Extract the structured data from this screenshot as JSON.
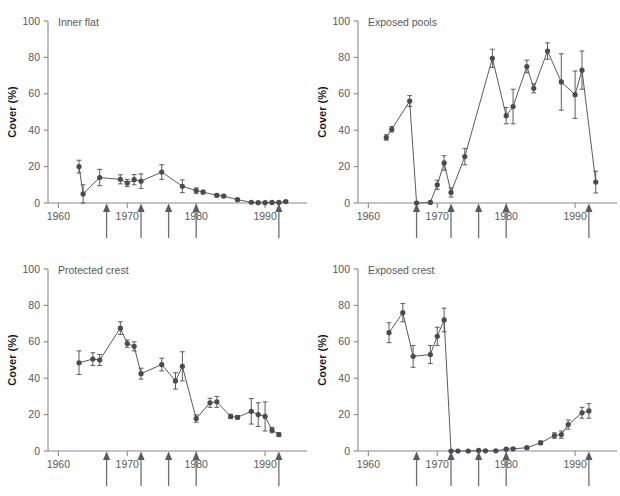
{
  "figure": {
    "background": "#ffffff",
    "marker_color": "#4a4a52",
    "line_color": "#5a5a62",
    "axis_color": "#8a8a8a",
    "text_color": "#58595b",
    "axis_label": "Cover (%)",
    "y_ticks": [
      0,
      20,
      40,
      60,
      80,
      100
    ],
    "y_tick_labels": [
      "0",
      "20",
      "40",
      "60",
      "80",
      "100"
    ],
    "x_ticks": [
      1960,
      1970,
      1980,
      1990
    ],
    "x_tick_labels": [
      "1960",
      "1970",
      "1980",
      "1990"
    ],
    "xlim": [
      1958.5,
      1995.5
    ],
    "ylim": [
      0,
      100
    ],
    "event_arrows": [
      1967,
      1972,
      1976,
      1980,
      1992
    ],
    "grid": false,
    "legend": "none"
  },
  "chart_data": [
    {
      "type": "line",
      "title": "Inner flat",
      "xlabel": "",
      "ylabel": "Cover (%)",
      "xlim": [
        1958.5,
        1995.5
      ],
      "ylim": [
        0,
        100
      ],
      "error_bars": true,
      "points": [
        {
          "x": 1963,
          "y": 20.0,
          "err": 3.5
        },
        {
          "x": 1963.6,
          "y": 5.0,
          "err": 5.0
        },
        {
          "x": 1966,
          "y": 14.0,
          "err": 4.5
        },
        {
          "x": 1969,
          "y": 13.0,
          "err": 2.5
        },
        {
          "x": 1970,
          "y": 11.0,
          "err": 2.0
        },
        {
          "x": 1971,
          "y": 12.8,
          "err": 2.8
        },
        {
          "x": 1972,
          "y": 12.0,
          "err": 4.0
        },
        {
          "x": 1975,
          "y": 17.0,
          "err": 4.0
        },
        {
          "x": 1978,
          "y": 9.2,
          "err": 3.5
        },
        {
          "x": 1980,
          "y": 6.8,
          "err": 1.5
        },
        {
          "x": 1981,
          "y": 6.0,
          "err": 1.0
        },
        {
          "x": 1983,
          "y": 4.2,
          "err": 0.8
        },
        {
          "x": 1984,
          "y": 3.8,
          "err": 0.8
        },
        {
          "x": 1986,
          "y": 1.8,
          "err": 0.6
        },
        {
          "x": 1988,
          "y": 0.4,
          "err": 0.3
        },
        {
          "x": 1989,
          "y": 0.2,
          "err": 0.3
        },
        {
          "x": 1990,
          "y": 0.2,
          "err": 0.3
        },
        {
          "x": 1991,
          "y": 0.3,
          "err": 0.3
        },
        {
          "x": 1992,
          "y": 0.3,
          "err": 0.3
        },
        {
          "x": 1993,
          "y": 0.8,
          "err": 0.4
        }
      ]
    },
    {
      "type": "line",
      "title": "Exposed pools",
      "xlabel": "",
      "ylabel": "Cover (%)",
      "xlim": [
        1958.5,
        1995.5
      ],
      "ylim": [
        0,
        100
      ],
      "error_bars": true,
      "points": [
        {
          "x": 1962.6,
          "y": 36.0,
          "err": 1.5
        },
        {
          "x": 1963.4,
          "y": 40.5,
          "err": 1.5
        },
        {
          "x": 1966,
          "y": 56.0,
          "err": 3.0
        },
        {
          "x": 1967,
          "y": 0.0,
          "err": 0.5
        },
        {
          "x": 1969,
          "y": 0.3,
          "err": 0.4
        },
        {
          "x": 1970,
          "y": 10.0,
          "err": 2.5
        },
        {
          "x": 1971,
          "y": 22.0,
          "err": 4.0
        },
        {
          "x": 1972,
          "y": 5.8,
          "err": 2.5
        },
        {
          "x": 1974,
          "y": 25.5,
          "err": 4.5
        },
        {
          "x": 1978,
          "y": 79.5,
          "err": 5.0
        },
        {
          "x": 1980,
          "y": 48.0,
          "err": 4.5
        },
        {
          "x": 1981,
          "y": 53.0,
          "err": 9.5
        },
        {
          "x": 1983,
          "y": 75.0,
          "err": 3.5
        },
        {
          "x": 1984,
          "y": 63.0,
          "err": 2.5
        },
        {
          "x": 1986,
          "y": 83.5,
          "err": 4.5
        },
        {
          "x": 1988,
          "y": 66.5,
          "err": 15.5
        },
        {
          "x": 1990,
          "y": 59.5,
          "err": 13.0
        },
        {
          "x": 1991,
          "y": 73.0,
          "err": 10.5
        },
        {
          "x": 1993,
          "y": 11.5,
          "err": 6.0
        }
      ]
    },
    {
      "type": "line",
      "title": "Protected crest",
      "xlabel": "",
      "ylabel": "Cover (%)",
      "xlim": [
        1958.5,
        1995.5
      ],
      "ylim": [
        0,
        100
      ],
      "error_bars": true,
      "points": [
        {
          "x": 1963,
          "y": 48.5,
          "err": 6.5
        },
        {
          "x": 1965,
          "y": 50.5,
          "err": 3.5
        },
        {
          "x": 1966,
          "y": 50.0,
          "err": 3.0
        },
        {
          "x": 1969,
          "y": 67.5,
          "err": 3.5
        },
        {
          "x": 1970,
          "y": 59.0,
          "err": 2.0
        },
        {
          "x": 1971,
          "y": 57.5,
          "err": 2.5
        },
        {
          "x": 1972,
          "y": 42.5,
          "err": 3.0
        },
        {
          "x": 1975,
          "y": 47.5,
          "err": 3.5
        },
        {
          "x": 1977,
          "y": 38.5,
          "err": 4.5
        },
        {
          "x": 1978,
          "y": 46.5,
          "err": 8.0
        },
        {
          "x": 1980,
          "y": 17.8,
          "err": 2.0
        },
        {
          "x": 1982,
          "y": 26.5,
          "err": 2.5
        },
        {
          "x": 1983,
          "y": 27.0,
          "err": 3.0
        },
        {
          "x": 1985,
          "y": 19.0,
          "err": 1.2
        },
        {
          "x": 1986,
          "y": 18.5,
          "err": 1.0
        },
        {
          "x": 1988,
          "y": 21.8,
          "err": 7.0
        },
        {
          "x": 1989,
          "y": 20.0,
          "err": 6.5
        },
        {
          "x": 1990,
          "y": 19.0,
          "err": 8.0
        },
        {
          "x": 1991,
          "y": 11.5,
          "err": 1.5
        },
        {
          "x": 1992,
          "y": 9.0,
          "err": 1.0
        }
      ]
    },
    {
      "type": "line",
      "title": "Exposed crest",
      "xlabel": "",
      "ylabel": "Cover (%)",
      "xlim": [
        1958.5,
        1995.5
      ],
      "ylim": [
        0,
        100
      ],
      "error_bars": true,
      "points": [
        {
          "x": 1963,
          "y": 65.0,
          "err": 5.5
        },
        {
          "x": 1965,
          "y": 76.0,
          "err": 5.0
        },
        {
          "x": 1966.5,
          "y": 52.0,
          "err": 6.0
        },
        {
          "x": 1969,
          "y": 53.0,
          "err": 5.0
        },
        {
          "x": 1970,
          "y": 63.0,
          "err": 5.0
        },
        {
          "x": 1971,
          "y": 72.0,
          "err": 6.5
        },
        {
          "x": 1972,
          "y": 0.0,
          "err": 0.4
        },
        {
          "x": 1973,
          "y": 0.0,
          "err": 0.3
        },
        {
          "x": 1974.5,
          "y": 0.0,
          "err": 0.3
        },
        {
          "x": 1976,
          "y": 0.3,
          "err": 0.3
        },
        {
          "x": 1977,
          "y": 0.1,
          "err": 0.3
        },
        {
          "x": 1978.5,
          "y": 0.1,
          "err": 0.3
        },
        {
          "x": 1980,
          "y": 1.0,
          "err": 0.5
        },
        {
          "x": 1981,
          "y": 1.2,
          "err": 0.5
        },
        {
          "x": 1983,
          "y": 1.8,
          "err": 0.5
        },
        {
          "x": 1985,
          "y": 4.5,
          "err": 1.0
        },
        {
          "x": 1987,
          "y": 8.5,
          "err": 1.5
        },
        {
          "x": 1988,
          "y": 9.0,
          "err": 2.0
        },
        {
          "x": 1989,
          "y": 14.5,
          "err": 2.5
        },
        {
          "x": 1991,
          "y": 21.0,
          "err": 3.0
        },
        {
          "x": 1992,
          "y": 22.0,
          "err": 4.0
        }
      ]
    }
  ]
}
